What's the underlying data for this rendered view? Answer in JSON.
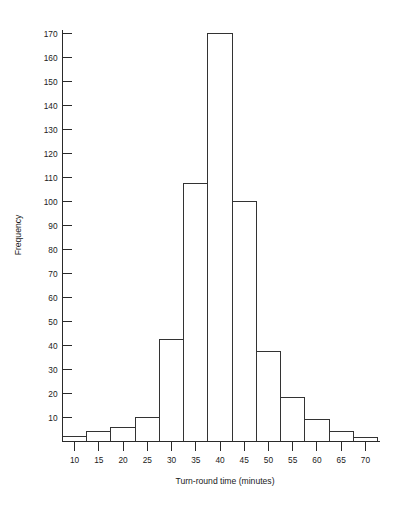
{
  "chart_data": {
    "type": "bar",
    "title": "",
    "subtitle": "",
    "xlabel": "Turn-round time (minutes)",
    "ylabel": "Frequency",
    "categories": [
      10,
      15,
      20,
      25,
      30,
      35,
      40,
      45,
      50,
      55,
      60,
      65,
      70
    ],
    "values": [
      2,
      4,
      6,
      10,
      42.5,
      107.5,
      170,
      100,
      37.5,
      18.5,
      9,
      4,
      1.5
    ],
    "bin_width": 5,
    "bin_edges": [
      7.5,
      12.5,
      17.5,
      22.5,
      27.5,
      32.5,
      37.5,
      42.5,
      47.5,
      52.5,
      57.5,
      62.5,
      67.5,
      72.5
    ],
    "xlim": [
      7.5,
      72.5
    ],
    "ylim": [
      0,
      174
    ],
    "x_tick_labels": [
      "10",
      "15",
      "20",
      "25",
      "30",
      "35",
      "40",
      "45",
      "50",
      "55",
      "60",
      "65",
      "70"
    ],
    "y_tick_labels": [
      "10",
      "20",
      "30",
      "40",
      "50",
      "60",
      "70",
      "80",
      "90",
      "100",
      "110",
      "120",
      "130",
      "140",
      "150",
      "160",
      "170"
    ],
    "y_ticks": [
      10,
      20,
      30,
      40,
      50,
      60,
      70,
      80,
      90,
      100,
      110,
      120,
      130,
      140,
      150,
      160,
      170
    ],
    "grid": false,
    "legend": "none",
    "bar_fill_color": "#ffffff",
    "bar_edge_color": "#333333",
    "axis_color": "#2a2a2a",
    "background_color": "#ffffff"
  }
}
